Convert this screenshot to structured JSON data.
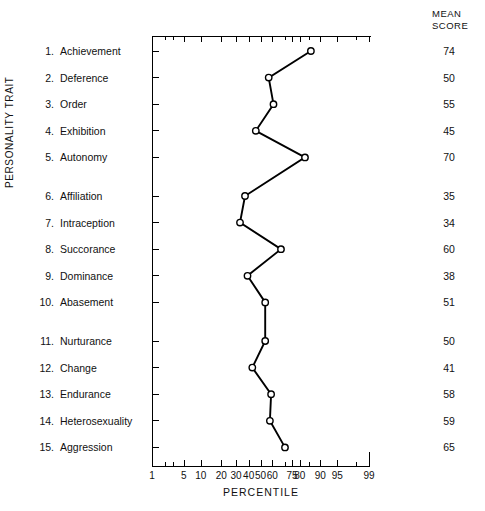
{
  "labels": {
    "y_axis_title": "PERSONALITY TRAIT",
    "mean_score_line1": "MEAN",
    "mean_score_line2": "SCORE",
    "x_axis_title": "PERCENTILE"
  },
  "chart_data": {
    "type": "line",
    "title": "",
    "xlabel": "PERCENTILE",
    "ylabel": "PERSONALITY TRAIT",
    "xscale": "normal-probability",
    "xlim": [
      1,
      99
    ],
    "xticks": [
      1,
      5,
      10,
      20,
      30,
      40,
      50,
      60,
      75,
      80,
      90,
      95,
      99
    ],
    "xtick_labels": [
      "1",
      "5",
      "10",
      "20",
      "30",
      "40",
      "50",
      "60",
      "75",
      "80",
      "90",
      "95",
      "99"
    ],
    "grid": false,
    "legend": false,
    "marker": "open-circle",
    "categories": [
      "Achievement",
      "Deference",
      "Order",
      "Exhibition",
      "Autonomy",
      "Affiliation",
      "Intraception",
      "Succorance",
      "Dominance",
      "Abasement",
      "Nurturance",
      "Change",
      "Endurance",
      "Heterosexuality",
      "Aggression"
    ],
    "series": [
      {
        "name": "Percentile",
        "values": [
          86,
          57,
          61,
          46,
          83,
          37,
          33,
          67,
          39,
          54,
          54,
          43,
          59,
          58,
          70
        ]
      }
    ]
  },
  "traits": [
    {
      "num": "1.",
      "name": "Achievement",
      "mean_score": "74",
      "percentile": 86
    },
    {
      "num": "2.",
      "name": "Deference",
      "mean_score": "50",
      "percentile": 57
    },
    {
      "num": "3.",
      "name": "Order",
      "mean_score": "55",
      "percentile": 61
    },
    {
      "num": "4.",
      "name": "Exhibition",
      "mean_score": "45",
      "percentile": 46
    },
    {
      "num": "5.",
      "name": "Autonomy",
      "mean_score": "70",
      "percentile": 83
    },
    {
      "num": "6.",
      "name": "Affiliation",
      "mean_score": "35",
      "percentile": 37
    },
    {
      "num": "7.",
      "name": "Intraception",
      "mean_score": "34",
      "percentile": 33
    },
    {
      "num": "8.",
      "name": "Succorance",
      "mean_score": "60",
      "percentile": 67
    },
    {
      "num": "9.",
      "name": "Dominance",
      "mean_score": "38",
      "percentile": 39
    },
    {
      "num": "10.",
      "name": "Abasement",
      "mean_score": "51",
      "percentile": 54
    },
    {
      "num": "11.",
      "name": "Nurturance",
      "mean_score": "50",
      "percentile": 54
    },
    {
      "num": "12.",
      "name": "Change",
      "mean_score": "41",
      "percentile": 43
    },
    {
      "num": "13.",
      "name": "Endurance",
      "mean_score": "58",
      "percentile": 59
    },
    {
      "num": "14.",
      "name": "Heterosexuality",
      "mean_score": "59",
      "percentile": 58
    },
    {
      "num": "15.",
      "name": "Aggression",
      "mean_score": "65",
      "percentile": 70
    }
  ],
  "colors": {
    "ink": "#000000",
    "paper": "#ffffff"
  }
}
